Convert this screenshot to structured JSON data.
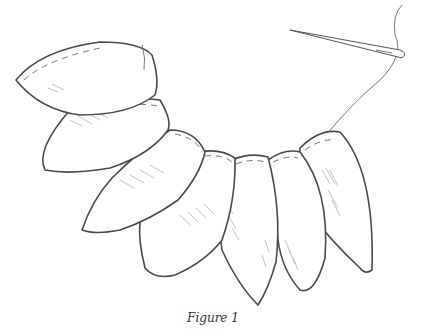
{
  "figure": {
    "caption": "Figure 1",
    "petal_count": 7,
    "colors": {
      "line": "#4a4a4a",
      "background": "#ffffff",
      "hatch": "#9a9a9a"
    }
  }
}
